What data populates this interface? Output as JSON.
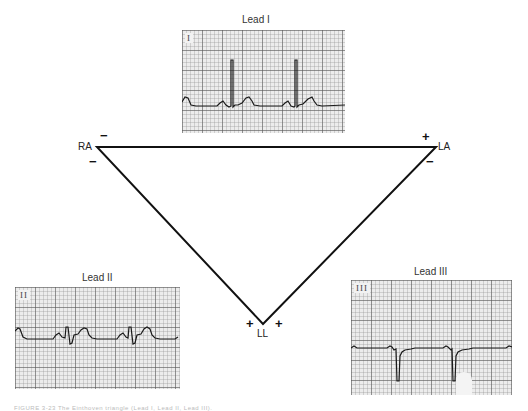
{
  "diagram": {
    "title": "Einthoven triangle",
    "leads": [
      {
        "title": "Lead I",
        "strip_label": "I"
      },
      {
        "title": "Lead II",
        "strip_label": "II"
      },
      {
        "title": "Lead III",
        "strip_label": "III"
      }
    ],
    "nodes": {
      "ra": {
        "label": "RA",
        "signs": [
          "−",
          "−"
        ]
      },
      "la": {
        "label": "LA",
        "signs": [
          "+",
          "−"
        ]
      },
      "ll": {
        "label": "LL",
        "signs": [
          "+",
          "+"
        ]
      }
    },
    "caption": "FIGURE 3-23 The Einthoven triangle (Lead I, Lead II, Lead III)."
  }
}
